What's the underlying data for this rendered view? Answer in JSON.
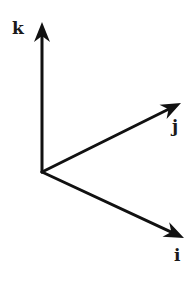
{
  "diagram": {
    "title": "",
    "origin": {
      "x": 42,
      "y": 172
    },
    "axes": [
      {
        "id": "k",
        "label": "k",
        "tip": {
          "x": 42,
          "y": 22
        },
        "label_pos": {
          "x": 12,
          "y": 34
        }
      },
      {
        "id": "j",
        "label": "j",
        "tip": {
          "x": 181,
          "y": 103
        },
        "label_pos": {
          "x": 172,
          "y": 132
        }
      },
      {
        "id": "i",
        "label": "i",
        "tip": {
          "x": 184,
          "y": 238
        },
        "label_pos": {
          "x": 174,
          "y": 261
        }
      }
    ],
    "colors": {
      "stroke": "#111111",
      "label": "#1a1a1a",
      "background": "#ffffff"
    }
  }
}
